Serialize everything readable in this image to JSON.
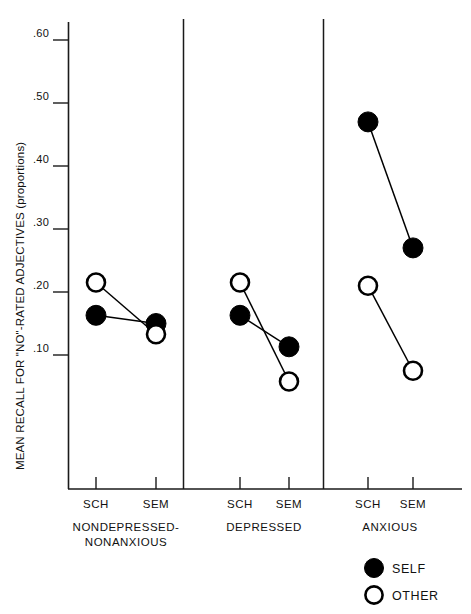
{
  "chart_data": {
    "type": "line",
    "title": "",
    "subtitle": "",
    "xlabel": "",
    "ylabel": "MEAN RECALL FOR \"NO\"-RATED ADJECTIVES (proportions)",
    "ylim": [
      0.0,
      0.635
    ],
    "ytick_values": [
      0.6,
      0.5,
      0.4,
      0.3,
      0.2,
      0.1
    ],
    "ytick_labels": [
      ".60",
      ".50",
      ".40",
      ".30",
      ".20",
      ".10"
    ],
    "grid": false,
    "legend_position": "bottom-right",
    "x_categories": [
      "SCH",
      "SEM"
    ],
    "panels": [
      {
        "name": "NONDEPRESSED-NONANXIOUS",
        "label_lines": [
          "NONDEPRESSED-",
          "NONANXIOUS"
        ],
        "x_ticks": [
          "SCH",
          "SEM"
        ],
        "series": [
          {
            "name": "SELF",
            "values": [
              0.163,
              0.15
            ]
          },
          {
            "name": "OTHER",
            "values": [
              0.215,
              0.133
            ]
          }
        ]
      },
      {
        "name": "DEPRESSED",
        "label_lines": [
          "DEPRESSED"
        ],
        "x_ticks": [
          "SCH",
          "SEM"
        ],
        "series": [
          {
            "name": "SELF",
            "values": [
              0.163,
              0.113
            ]
          },
          {
            "name": "OTHER",
            "values": [
              0.215,
              0.058
            ]
          }
        ]
      },
      {
        "name": "ANXIOUS",
        "label_lines": [
          "ANXIOUS"
        ],
        "x_ticks": [
          "SCH",
          "SEM"
        ],
        "series": [
          {
            "name": "SELF",
            "values": [
              0.47,
              0.27
            ]
          },
          {
            "name": "OTHER",
            "values": [
              0.21,
              0.075
            ]
          }
        ]
      }
    ],
    "legend": [
      {
        "label": "SELF",
        "marker": "filled-circle",
        "color": "#000000"
      },
      {
        "label": "OTHER",
        "marker": "open-circle",
        "color": "#ffffff"
      }
    ]
  },
  "axis": {
    "y_label": "MEAN RECALL FOR \"NO\"-RATED ADJECTIVES (proportions)",
    "y_ticks": [
      ".60",
      ".50",
      ".40",
      ".30",
      ".20",
      ".10"
    ]
  },
  "panel_labels": {
    "p0_line1": "NONDEPRESSED-",
    "p0_line2": "NONANXIOUS",
    "p1_line1": "DEPRESSED",
    "p2_line1": "ANXIOUS"
  },
  "x_tick_labels": {
    "p0_sch": "SCH",
    "p0_sem": "SEM",
    "p1_sch": "SCH",
    "p1_sem": "SEM",
    "p2_sch": "SCH",
    "p2_sem": "SEM"
  },
  "legend": {
    "self_label": "SELF",
    "other_label": "OTHER"
  },
  "colors": {
    "ink": "#000000",
    "axis": "#1a1a1a",
    "paper": "#ffffff"
  }
}
